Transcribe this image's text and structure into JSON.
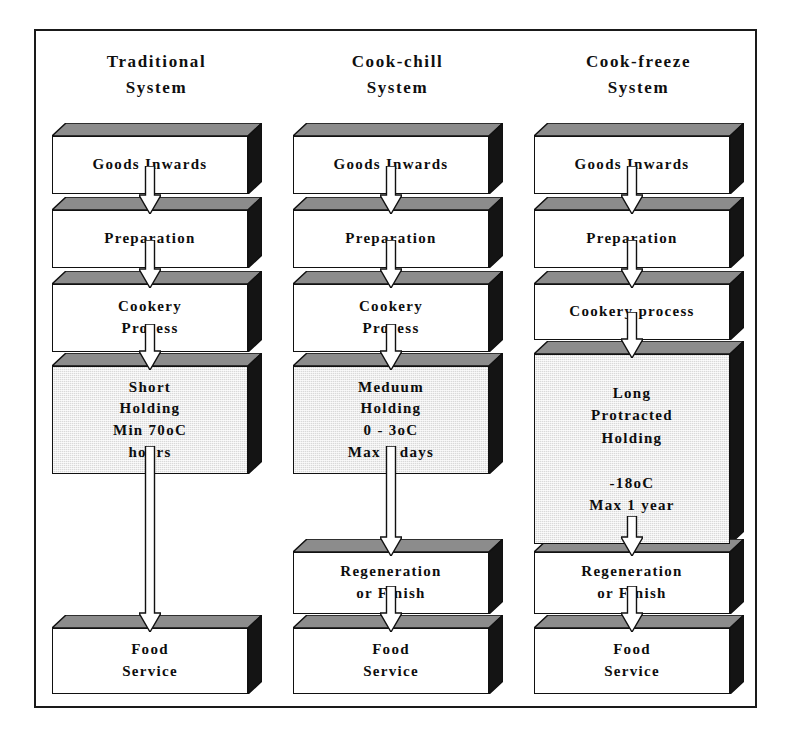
{
  "diagram": {
    "colors": {
      "border": "#1a1a1a",
      "box_outline": "#111111",
      "box_top_face": "#8c8c8c",
      "box_side_face": "#141414",
      "box_fill_plain": "#ffffff",
      "box_fill_shaded": "#d9d9d9",
      "text": "#0d0d0d"
    },
    "columns": [
      {
        "id": "traditional",
        "title": "Traditional\nSystem",
        "steps": [
          {
            "id": "goods-inwards",
            "label": "Goods Inwards",
            "shaded": false
          },
          {
            "id": "preparation",
            "label": "Preparation",
            "shaded": false
          },
          {
            "id": "cookery-process",
            "label": "Cookery\nProcess",
            "shaded": false
          },
          {
            "id": "holding",
            "label": "Short\nHolding\nMin 70oC\nhours",
            "shaded": true
          },
          {
            "id": "food-service",
            "label": "Food\nService",
            "shaded": false
          }
        ]
      },
      {
        "id": "cook-chill",
        "title": "Cook-chill\nSystem",
        "steps": [
          {
            "id": "goods-inwards",
            "label": "Goods Inwards",
            "shaded": false
          },
          {
            "id": "preparation",
            "label": "Preparation",
            "shaded": false
          },
          {
            "id": "cookery-process",
            "label": "Cookery\nProcess",
            "shaded": false
          },
          {
            "id": "holding",
            "label": "Meduum\nHolding\n0 - 3oC\nMax 5 days",
            "shaded": true
          },
          {
            "id": "regeneration",
            "label": "Regeneration\nor Finish",
            "shaded": false
          },
          {
            "id": "food-service",
            "label": "Food\nService",
            "shaded": false
          }
        ]
      },
      {
        "id": "cook-freeze",
        "title": "Cook-freeze\nSystem",
        "steps": [
          {
            "id": "goods-inwards",
            "label": "Goods Inwards",
            "shaded": false
          },
          {
            "id": "preparation",
            "label": "Preparation",
            "shaded": false
          },
          {
            "id": "cookery-process",
            "label": "Cookery process",
            "shaded": false
          },
          {
            "id": "holding",
            "label": "Long\nProtracted\nHolding\n\n-18oC\nMax 1 year",
            "shaded": true
          },
          {
            "id": "regeneration",
            "label": "Regeneration\nor Finish",
            "shaded": false
          },
          {
            "id": "food-service",
            "label": "Food\nService",
            "shaded": false
          }
        ]
      }
    ]
  },
  "layout": {
    "box_width": 196,
    "geometry": [
      [
        {
          "top": 92,
          "height": 58
        },
        {
          "top": 166,
          "height": 58
        },
        {
          "top": 240,
          "height": 68
        },
        {
          "top": 322,
          "height": 108
        },
        {
          "top": 584,
          "height": 66
        }
      ],
      [
        {
          "top": 92,
          "height": 58
        },
        {
          "top": 166,
          "height": 58
        },
        {
          "top": 240,
          "height": 68
        },
        {
          "top": 322,
          "height": 108
        },
        {
          "top": 508,
          "height": 62
        },
        {
          "top": 584,
          "height": 66
        }
      ],
      [
        {
          "top": 92,
          "height": 58
        },
        {
          "top": 166,
          "height": 58
        },
        {
          "top": 240,
          "height": 56
        },
        {
          "top": 310,
          "height": 190
        },
        {
          "top": 508,
          "height": 62
        },
        {
          "top": 584,
          "height": 66
        }
      ]
    ]
  }
}
